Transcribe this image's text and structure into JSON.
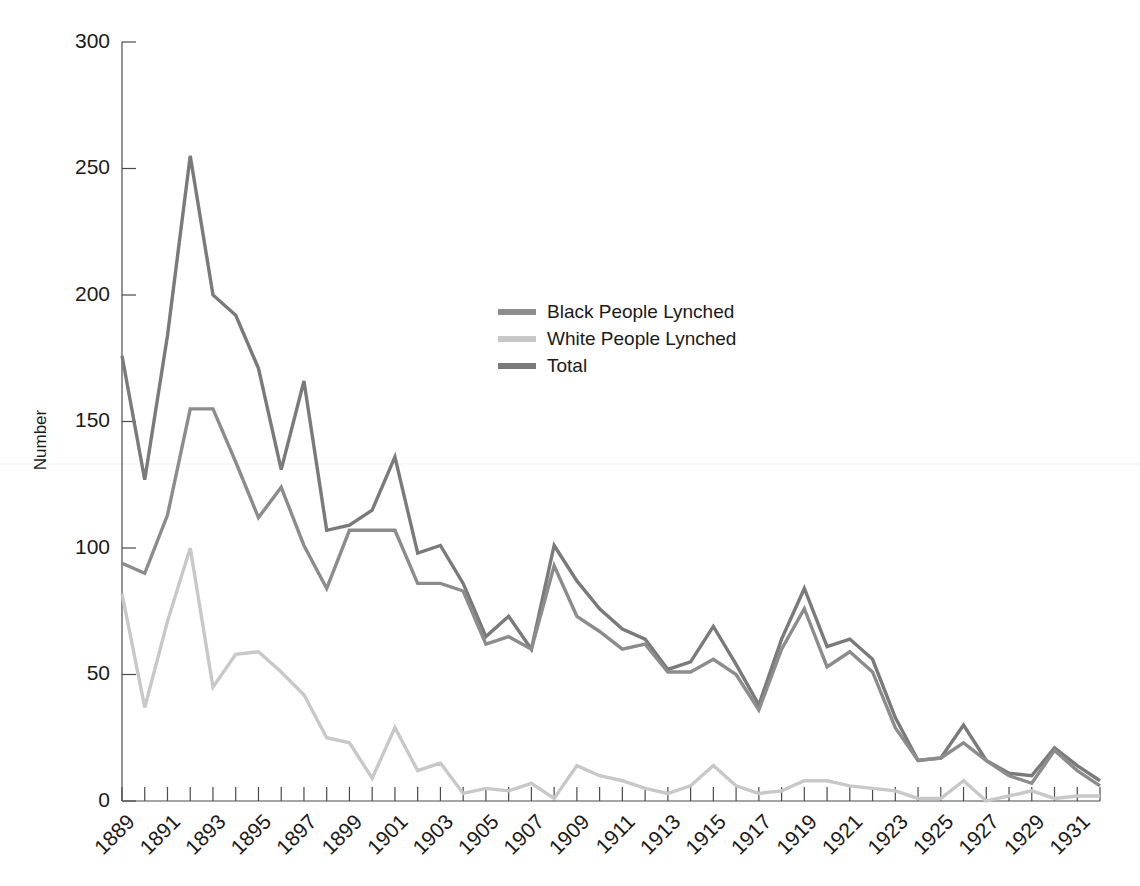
{
  "chart_data": {
    "type": "line",
    "title": "",
    "xlabel": "",
    "ylabel": "Number",
    "xlim": [
      1889,
      1932
    ],
    "ylim": [
      0,
      300
    ],
    "yticks": [
      0,
      50,
      100,
      150,
      200,
      250,
      300
    ],
    "ytick_labels": [
      "0",
      "50",
      "100",
      "150",
      "200",
      "250",
      "300"
    ],
    "grid": false,
    "legend_position": "upper-center",
    "x": [
      1889,
      1890,
      1891,
      1892,
      1893,
      1894,
      1895,
      1896,
      1897,
      1898,
      1899,
      1900,
      1901,
      1902,
      1903,
      1904,
      1905,
      1906,
      1907,
      1908,
      1909,
      1910,
      1911,
      1912,
      1913,
      1914,
      1915,
      1916,
      1917,
      1918,
      1919,
      1920,
      1921,
      1922,
      1923,
      1924,
      1925,
      1926,
      1927,
      1928,
      1929,
      1930,
      1931,
      1932
    ],
    "xtick_labels": [
      "1889",
      "1891",
      "1893",
      "1895",
      "1897",
      "1899",
      "1901",
      "1903",
      "1905",
      "1907",
      "1909",
      "1911",
      "1913",
      "1915",
      "1917",
      "1919",
      "1921",
      "1923",
      "1925",
      "1927",
      "1929",
      "1931"
    ],
    "xtick_values": [
      1889,
      1891,
      1893,
      1895,
      1897,
      1899,
      1901,
      1903,
      1905,
      1907,
      1909,
      1911,
      1913,
      1915,
      1917,
      1919,
      1921,
      1923,
      1925,
      1927,
      1929,
      1931
    ],
    "series": [
      {
        "name": "Black People Lynched",
        "color": "#8c8c8c",
        "values": [
          94,
          90,
          113,
          155,
          155,
          134,
          112,
          124,
          101,
          84,
          107,
          107,
          107,
          86,
          86,
          83,
          62,
          65,
          60,
          93,
          73,
          67,
          60,
          62,
          51,
          51,
          56,
          50,
          36,
          60,
          76,
          53,
          59,
          51,
          29,
          16,
          17,
          23,
          16,
          10,
          7,
          20,
          12,
          6
        ]
      },
      {
        "name": "White People Lynched",
        "color": "#c8c8c8",
        "values": [
          82,
          37,
          71,
          100,
          45,
          58,
          59,
          51,
          42,
          25,
          23,
          9,
          29,
          12,
          15,
          3,
          5,
          4,
          7,
          1,
          14,
          10,
          8,
          5,
          3,
          6,
          14,
          6,
          3,
          4,
          8,
          8,
          6,
          5,
          4,
          1,
          1,
          8,
          0,
          2,
          4,
          1,
          2,
          2
        ]
      },
      {
        "name": "Total",
        "color": "#7a7a7a",
        "values": [
          176,
          127,
          184,
          255,
          200,
          192,
          171,
          131,
          166,
          107,
          109,
          115,
          136,
          98,
          101,
          86,
          65,
          73,
          60,
          101,
          87,
          76,
          68,
          64,
          52,
          55,
          69,
          54,
          38,
          64,
          84,
          61,
          64,
          56,
          33,
          16,
          17,
          30,
          16,
          11,
          10,
          21,
          14,
          8
        ]
      }
    ]
  },
  "legend": {
    "items": [
      {
        "label": "Black People Lynched",
        "color": "#8c8c8c"
      },
      {
        "label": "White People Lynched",
        "color": "#c8c8c8"
      },
      {
        "label": "Total",
        "color": "#7a7a7a"
      }
    ]
  },
  "axes": {
    "y_title": "Number"
  }
}
